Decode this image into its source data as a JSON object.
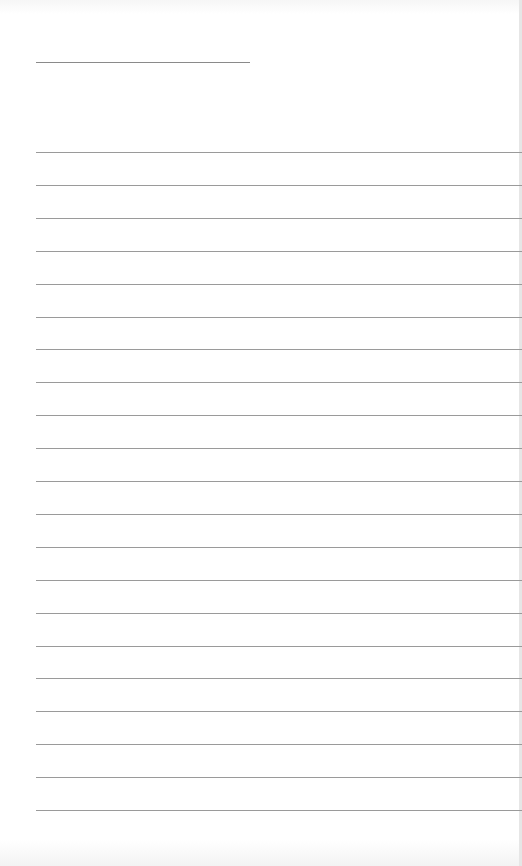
{
  "document": {
    "type": "lined-paper",
    "title_line": {
      "left": 36,
      "top": 62,
      "width": 214
    },
    "rules": {
      "count": 21,
      "left": 36,
      "first_top": 152,
      "spacing": 32.9,
      "color": "#9a9a9a"
    },
    "text": ""
  }
}
